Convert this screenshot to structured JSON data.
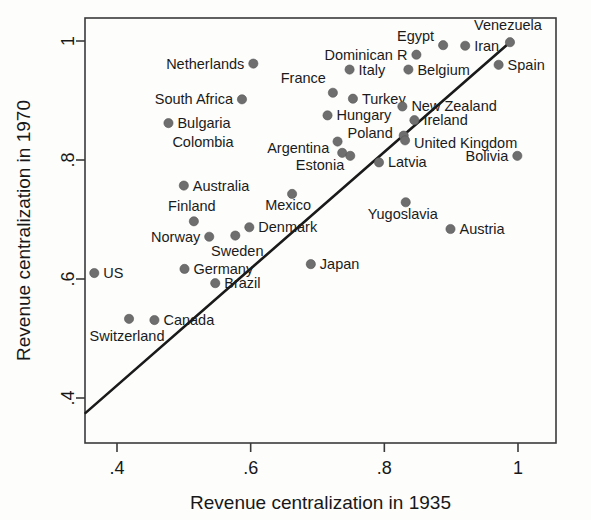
{
  "chart_data": {
    "type": "scatter",
    "title": "",
    "xlabel": "Revenue centralization in 1935",
    "ylabel": "Revenue centralization in 1970",
    "xlim": [
      0.33,
      1.03
    ],
    "ylim": [
      0.355,
      1.02
    ],
    "xticks": [
      0.4,
      0.6,
      0.8,
      1.0
    ],
    "xticklabels": [
      ".4",
      ".6",
      ".8",
      "1"
    ],
    "yticks": [
      0.4,
      0.6,
      0.8,
      1.0
    ],
    "yticklabels": [
      ".4",
      ".6",
      ".8",
      "1"
    ],
    "grid": false,
    "legend": null,
    "reference_line": {
      "type": "45-degree-line",
      "x_start": 0.353,
      "y_start": 0.375,
      "x_end": 0.988,
      "y_end": 0.998
    },
    "marker_color": "#6e6e6e",
    "points": [
      {
        "name": "Venezuela",
        "x": 0.988,
        "y": 0.998,
        "label_dx": -2,
        "label_dy": -12,
        "anchor": "middle"
      },
      {
        "name": "Iran",
        "x": 0.921,
        "y": 0.992,
        "label_dx": 9,
        "label_dy": 5,
        "anchor": "start"
      },
      {
        "name": "Egypt",
        "x": 0.888,
        "y": 0.993,
        "label_dx": -9,
        "label_dy": -4,
        "anchor": "end"
      },
      {
        "name": "Spain",
        "x": 0.971,
        "y": 0.96,
        "label_dx": 9,
        "label_dy": 5,
        "anchor": "start"
      },
      {
        "name": "Dominican R",
        "x": 0.848,
        "y": 0.977,
        "label_dx": -9,
        "label_dy": 5,
        "anchor": "end"
      },
      {
        "name": "Belgium",
        "x": 0.836,
        "y": 0.952,
        "label_dx": 9,
        "label_dy": 5,
        "anchor": "start"
      },
      {
        "name": "Italy",
        "x": 0.748,
        "y": 0.952,
        "label_dx": 9,
        "label_dy": 5,
        "anchor": "start"
      },
      {
        "name": "Netherlands",
        "x": 0.604,
        "y": 0.962,
        "label_dx": -9,
        "label_dy": 5,
        "anchor": "end"
      },
      {
        "name": "France",
        "x": 0.723,
        "y": 0.913,
        "label_dx": -7,
        "label_dy": -10,
        "anchor": "end"
      },
      {
        "name": "Turkey",
        "x": 0.753,
        "y": 0.903,
        "label_dx": 9,
        "label_dy": 5,
        "anchor": "start"
      },
      {
        "name": "South Africa",
        "x": 0.587,
        "y": 0.902,
        "label_dx": -9,
        "label_dy": 5,
        "anchor": "end"
      },
      {
        "name": "New Zealand",
        "x": 0.827,
        "y": 0.89,
        "label_dx": 9,
        "label_dy": 5,
        "anchor": "start"
      },
      {
        "name": "Hungary",
        "x": 0.715,
        "y": 0.875,
        "label_dx": 9,
        "label_dy": 5,
        "anchor": "start"
      },
      {
        "name": "Bulgaria",
        "x": 0.477,
        "y": 0.862,
        "label_dx": 9,
        "label_dy": 5,
        "anchor": "start"
      },
      {
        "name": "Ireland",
        "x": 0.845,
        "y": 0.867,
        "label_dx": 9,
        "label_dy": 5,
        "anchor": "start"
      },
      {
        "name": "Colombia",
        "x": 0.73,
        "y": 0.831,
        "label_dx": -9,
        "label_dy": 5,
        "anchor": "end",
        "label_x_override": 0.588
      },
      {
        "name": "Poland",
        "x": 0.829,
        "y": 0.841,
        "label_dx": -11,
        "label_dy": 2,
        "anchor": "end"
      },
      {
        "name": "United Kingdom",
        "x": 0.831,
        "y": 0.833,
        "label_dx": 9,
        "label_dy": 8,
        "anchor": "start"
      },
      {
        "name": "Argentina",
        "x": 0.737,
        "y": 0.812,
        "label_dx": -13,
        "label_dy": 0,
        "anchor": "end"
      },
      {
        "name": "Estonia",
        "x": 0.749,
        "y": 0.807,
        "label_dx": -6,
        "label_dy": 14,
        "anchor": "end"
      },
      {
        "name": "Latvia",
        "x": 0.792,
        "y": 0.796,
        "label_dx": 9,
        "label_dy": 5,
        "anchor": "start"
      },
      {
        "name": "Bolivia",
        "x": 0.999,
        "y": 0.807,
        "label_dx": -9,
        "label_dy": 5,
        "anchor": "end"
      },
      {
        "name": "Australia",
        "x": 0.5,
        "y": 0.757,
        "label_dx": 9,
        "label_dy": 5,
        "anchor": "start"
      },
      {
        "name": "Mexico",
        "x": 0.662,
        "y": 0.743,
        "label_dx": -4,
        "label_dy": 16,
        "anchor": "middle"
      },
      {
        "name": "Yugoslavia",
        "x": 0.832,
        "y": 0.729,
        "label_dx": -3,
        "label_dy": 17,
        "anchor": "middle"
      },
      {
        "name": "Austria",
        "x": 0.899,
        "y": 0.684,
        "label_dx": 9,
        "label_dy": 5,
        "anchor": "start"
      },
      {
        "name": "Finland",
        "x": 0.515,
        "y": 0.697,
        "label_dx": -2,
        "label_dy": -10,
        "anchor": "middle"
      },
      {
        "name": "Denmark",
        "x": 0.598,
        "y": 0.687,
        "label_dx": 9,
        "label_dy": 5,
        "anchor": "start"
      },
      {
        "name": "Norway",
        "x": 0.538,
        "y": 0.671,
        "label_dx": -9,
        "label_dy": 5,
        "anchor": "end"
      },
      {
        "name": "Sweden",
        "x": 0.577,
        "y": 0.673,
        "label_dx": 2,
        "label_dy": 20,
        "anchor": "middle"
      },
      {
        "name": "Germany",
        "x": 0.501,
        "y": 0.617,
        "label_dx": 9,
        "label_dy": 5,
        "anchor": "start"
      },
      {
        "name": "Brazil",
        "x": 0.547,
        "y": 0.593,
        "label_dx": 9,
        "label_dy": 5,
        "anchor": "start"
      },
      {
        "name": "US",
        "x": 0.366,
        "y": 0.61,
        "label_dx": 9,
        "label_dy": 5,
        "anchor": "start"
      },
      {
        "name": "Japan",
        "x": 0.69,
        "y": 0.625,
        "label_dx": 9,
        "label_dy": 5,
        "anchor": "start"
      },
      {
        "name": "Canada",
        "x": 0.456,
        "y": 0.531,
        "label_dx": 9,
        "label_dy": 5,
        "anchor": "start"
      },
      {
        "name": "Switzerland",
        "x": 0.418,
        "y": 0.533,
        "label_dx": -2,
        "label_dy": 22,
        "anchor": "middle"
      }
    ]
  }
}
